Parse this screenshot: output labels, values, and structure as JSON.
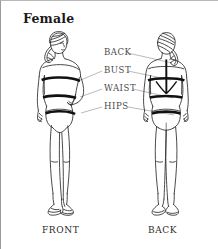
{
  "title": "Female",
  "captions": {
    "front": "FRONT",
    "back": "BACK"
  },
  "measurement_labels": [
    {
      "id": "back",
      "text": "BACK",
      "x": 103,
      "y": 54
    },
    {
      "id": "bust",
      "text": "BUST",
      "x": 103,
      "y": 72
    },
    {
      "id": "waist",
      "text": "WAIST",
      "x": 103,
      "y": 90
    },
    {
      "id": "hips",
      "text": "HIPS",
      "x": 103,
      "y": 108
    }
  ],
  "figures": [
    {
      "id": "front-figure",
      "caption_key": "front",
      "view": "front"
    },
    {
      "id": "back-figure",
      "caption_key": "back",
      "view": "back"
    }
  ],
  "colors": {
    "band": "#111111",
    "outline": "#2b2b2b",
    "leader_line": "#8c8c8c",
    "label_text": "#4a4a4a",
    "title_text": "#1a1a1a",
    "background": "#ffffff",
    "border": "#9a9a9a"
  },
  "icon_names": [
    "female-front-body-icon",
    "female-back-body-icon",
    "measurement-band-icon",
    "leader-line-icon"
  ]
}
